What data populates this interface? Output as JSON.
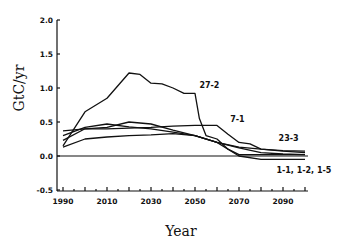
{
  "chart_data": {
    "type": "line",
    "title": "",
    "xlabel": "Year",
    "ylabel": "GtC/yr",
    "xlim": [
      1990,
      2100
    ],
    "ylim": [
      -0.5,
      2.0
    ],
    "grid": false,
    "legend": "inline labels",
    "x_ticks": [
      1990,
      2010,
      2030,
      2050,
      2070,
      2090
    ],
    "y_ticks": [
      "2.0",
      "1.5",
      "1.0",
      "0.5",
      "0.0",
      "-0.5"
    ],
    "series": [
      {
        "name": "27-2",
        "x": [
          1990,
          2000,
          2010,
          2020,
          2025,
          2030,
          2035,
          2040,
          2045,
          2050,
          2052,
          2055,
          2060,
          2065,
          2070,
          2080,
          2090,
          2100
        ],
        "values": [
          0.15,
          0.65,
          0.85,
          1.22,
          1.2,
          1.07,
          1.06,
          1.0,
          0.92,
          0.92,
          0.55,
          0.3,
          0.25,
          0.1,
          0.02,
          0.02,
          0.02,
          0.02
        ]
      },
      {
        "name": "7-1",
        "x": [
          1990,
          2000,
          2010,
          2020,
          2030,
          2040,
          2050,
          2060,
          2065,
          2070,
          2075,
          2080,
          2090,
          2100
        ],
        "values": [
          0.37,
          0.4,
          0.4,
          0.41,
          0.42,
          0.44,
          0.45,
          0.45,
          0.32,
          0.2,
          0.18,
          0.1,
          0.07,
          0.05
        ]
      },
      {
        "name": "23-3",
        "x": [
          1990,
          2000,
          2010,
          2020,
          2030,
          2040,
          2050,
          2060,
          2070,
          2080,
          2090,
          2100
        ],
        "values": [
          0.13,
          0.25,
          0.28,
          0.3,
          0.31,
          0.33,
          0.3,
          0.2,
          0.13,
          0.1,
          0.08,
          0.07
        ]
      },
      {
        "name": "1-1, 1-2, 1-5 (a)",
        "x": [
          1990,
          2000,
          2010,
          2020,
          2030,
          2040,
          2050,
          2060,
          2065,
          2070,
          2080,
          2090,
          2100
        ],
        "values": [
          0.3,
          0.42,
          0.47,
          0.43,
          0.4,
          0.35,
          0.3,
          0.2,
          0.1,
          0.0,
          -0.05,
          -0.05,
          -0.05
        ]
      },
      {
        "name": "1-1, 1-2, 1-5 (b)",
        "x": [
          1990,
          2000,
          2010,
          2020,
          2030,
          2040,
          2050,
          2060,
          2070,
          2080,
          2090,
          2100
        ],
        "values": [
          0.23,
          0.4,
          0.42,
          0.5,
          0.47,
          0.38,
          0.3,
          0.2,
          0.12,
          0.05,
          0.03,
          0.02
        ]
      }
    ],
    "labels": [
      {
        "text": "27-2",
        "year": 2052,
        "value": 1.0
      },
      {
        "text": "7-1",
        "year": 2066,
        "value": 0.5
      },
      {
        "text": "23-3",
        "year": 2088,
        "value": 0.22
      },
      {
        "text": "1-1, 1-2, 1-5",
        "year": 2087,
        "value": -0.25
      }
    ]
  }
}
